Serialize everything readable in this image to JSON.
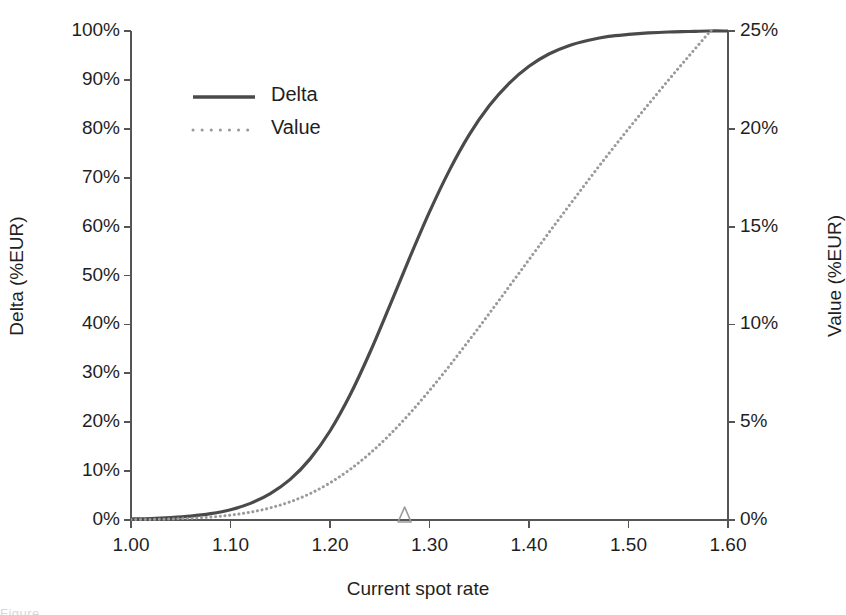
{
  "chart_data": {
    "type": "line",
    "title": "",
    "xlabel": "Current spot rate",
    "ylabel": "Delta (%EUR)",
    "y2label": "Value (%EUR)",
    "xlim": [
      1.0,
      1.6
    ],
    "ylim": [
      0,
      100
    ],
    "y2lim": [
      0,
      25
    ],
    "grid": false,
    "legend_position": "upper-left-inside",
    "xticks": [
      "1.00",
      "1.10",
      "1.20",
      "1.30",
      "1.40",
      "1.50",
      "1.60"
    ],
    "xtick_values": [
      1.0,
      1.1,
      1.2,
      1.3,
      1.4,
      1.5,
      1.6
    ],
    "yticks": [
      "0%",
      "10%",
      "20%",
      "30%",
      "40%",
      "50%",
      "60%",
      "70%",
      "80%",
      "90%",
      "100%"
    ],
    "ytick_values": [
      0,
      10,
      20,
      30,
      40,
      50,
      60,
      70,
      80,
      90,
      100
    ],
    "y2ticks": [
      "0%",
      "5%",
      "10%",
      "15%",
      "20%",
      "25%"
    ],
    "y2tick_values": [
      0,
      5,
      10,
      15,
      20,
      25
    ],
    "x": [
      1.0,
      1.02,
      1.04,
      1.06,
      1.08,
      1.1,
      1.12,
      1.14,
      1.16,
      1.18,
      1.2,
      1.22,
      1.24,
      1.26,
      1.28,
      1.3,
      1.32,
      1.34,
      1.36,
      1.38,
      1.4,
      1.42,
      1.44,
      1.46,
      1.48,
      1.5,
      1.52,
      1.54,
      1.56,
      1.58,
      1.6
    ],
    "series": [
      {
        "name": "Delta",
        "axis": "left",
        "style": "solid",
        "color": "#4a4a4a",
        "width": 3.2,
        "units": "%EUR",
        "values": [
          0.2,
          0.3,
          0.5,
          0.8,
          1.3,
          2.1,
          3.4,
          5.4,
          8.3,
          12.5,
          18.2,
          25.5,
          34.2,
          43.8,
          53.6,
          63.0,
          71.5,
          78.8,
          84.7,
          89.3,
          92.8,
          95.3,
          97.0,
          98.1,
          98.9,
          99.3,
          99.6,
          99.8,
          99.9,
          100.0,
          100.0
        ]
      },
      {
        "name": "Value",
        "axis": "right",
        "style": "dotted",
        "color": "#9a9a9a",
        "width": 3.0,
        "units": "%EUR",
        "values": [
          0.02,
          0.03,
          0.05,
          0.09,
          0.15,
          0.25,
          0.4,
          0.62,
          0.93,
          1.35,
          1.9,
          2.58,
          3.4,
          4.36,
          5.44,
          6.62,
          7.88,
          9.2,
          10.55,
          11.93,
          13.31,
          14.69,
          16.05,
          17.4,
          18.72,
          20.0,
          21.25,
          22.48,
          23.68,
          24.86,
          26.0
        ]
      }
    ],
    "markers": [
      {
        "name": "spot-marker",
        "shape": "triangle",
        "x": 1.275,
        "y": 0,
        "color": "#9a9a9a",
        "fill": "none"
      }
    ]
  },
  "legend": {
    "entries": [
      {
        "label": "Delta",
        "style": "solid"
      },
      {
        "label": "Value",
        "style": "dotted"
      }
    ]
  },
  "caption": {
    "fragment": "Figure"
  },
  "colors": {
    "delta": "#4a4a4a",
    "value": "#9a9a9a",
    "axis": "#555555",
    "text": "#1f1f1f",
    "background": "#ffffff"
  }
}
